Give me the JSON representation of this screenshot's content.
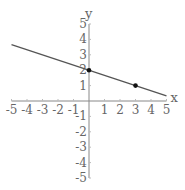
{
  "chart_data": {
    "type": "line",
    "title": "",
    "xlabel": "x",
    "ylabel": "y",
    "xlim": [
      -5,
      5
    ],
    "ylim": [
      -5,
      5
    ],
    "grid": false,
    "xticks": [
      -5,
      -4,
      -3,
      -2,
      -1,
      1,
      2,
      3,
      4,
      5
    ],
    "yticks": [
      5,
      4,
      3,
      2,
      1,
      -1,
      -2,
      -3,
      -4,
      -5
    ],
    "xtick_labels": [
      "-5",
      "-4",
      "-3",
      "-2",
      "-1",
      "1",
      "2",
      "3",
      "4",
      "5"
    ],
    "ytick_labels": [
      "5",
      "4",
      "3",
      "2",
      "1",
      "-1",
      "-2",
      "-3",
      "-4",
      "-5"
    ],
    "series": [
      {
        "name": "line",
        "equation": "y = -x/3 + 2",
        "x": [
          -5,
          5
        ],
        "y": [
          3.667,
          0.333
        ]
      }
    ],
    "points": [
      {
        "name": "y-intercept",
        "x": 0,
        "y": 2
      },
      {
        "name": "point",
        "x": 3,
        "y": 1
      }
    ]
  }
}
